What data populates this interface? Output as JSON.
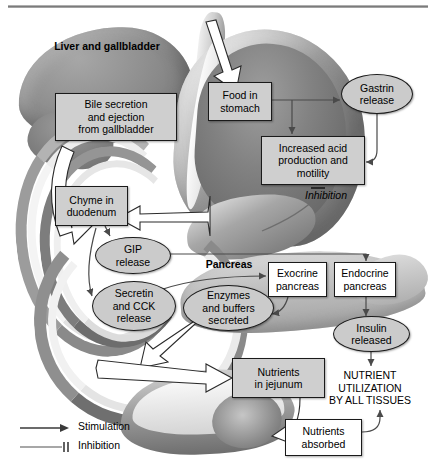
{
  "figure": {
    "type": "flow-diagram"
  },
  "anatomy_labels": {
    "liver": "Liver and gallbladder",
    "pancreas": "Pancreas"
  },
  "nodes": {
    "bile_secretion": "Bile secretion and ejection from gallbladder",
    "bile_secretion_lines": [
      "Bile secretion",
      "and ejection",
      "from gallbladder"
    ],
    "chyme_duodenum_lines": [
      "Chyme in",
      "duodenum"
    ],
    "food_stomach_lines": [
      "Food in",
      "stomach"
    ],
    "gastrin_release_lines": [
      "Gastrin",
      "release"
    ],
    "increased_acid_lines": [
      "Increased acid",
      "production and",
      "motility"
    ],
    "gip_release_lines": [
      "GIP",
      "release"
    ],
    "secretin_cck_lines": [
      "Secretin",
      "and CCK",
      "release"
    ],
    "enzymes_buffers_lines": [
      "Enzymes",
      "and buffers",
      "secreted"
    ],
    "exocrine_pancreas_lines": [
      "Exocrine",
      "pancreas"
    ],
    "endocrine_pancreas_lines": [
      "Endocrine",
      "pancreas"
    ],
    "insulin_released_lines": [
      "Insulin",
      "released"
    ],
    "nutrients_jejunum_lines": [
      "Nutrients",
      "in jejunum"
    ],
    "nutrients_absorbed_lines": [
      "Nutrients",
      "absorbed"
    ],
    "nutrient_utilization_lines": [
      "NUTRIENT",
      "UTILIZATION",
      "BY ALL TISSUES"
    ]
  },
  "annotations": {
    "inhibition_marker": "Inhibition"
  },
  "legend": {
    "items": [
      {
        "symbol": "arrow",
        "label": "Stimulation"
      },
      {
        "symbol": "tee",
        "label": "Inhibition"
      }
    ]
  },
  "colors": {
    "node_fill": "#cfcfcf",
    "node_fill_white": "#ffffff",
    "node_border": "#1a1a1a",
    "connector": "#4a4a4a",
    "process_arrow": "#ffffff",
    "process_arrow_border": "#2b2b2b"
  }
}
